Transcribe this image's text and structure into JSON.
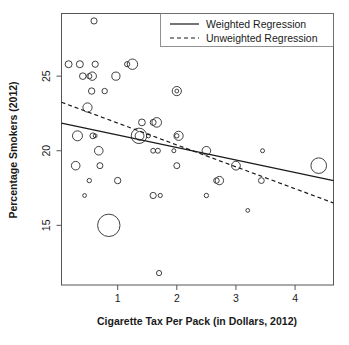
{
  "chart_data": {
    "type": "scatter",
    "title": "",
    "xlabel": "Cigarette Tax Per Pack (in Dollars, 2012)",
    "ylabel": "Percentage Smokers (2012)",
    "xlim": [
      0.05,
      4.65
    ],
    "ylim": [
      11.0,
      29.2
    ],
    "xticks": [
      1,
      2,
      3,
      4
    ],
    "yticks": [
      15,
      20,
      25
    ],
    "xtick_labels": [
      "1",
      "2",
      "3",
      "4"
    ],
    "ytick_labels": [
      "15",
      "20",
      "25"
    ],
    "grid": false,
    "legend_position": "top-right",
    "marker": "open-circle",
    "size_encoding": "population weight (bubble radius)",
    "legend": [
      {
        "label": "Weighted Regression",
        "style": "solid"
      },
      {
        "label": "Unweighted Regression",
        "style": "dashed"
      }
    ],
    "series": [
      {
        "name": "States",
        "points": [
          {
            "x": 0.6,
            "y": 28.7,
            "r": 3.1
          },
          {
            "x": 0.17,
            "y": 25.8,
            "r": 3.5
          },
          {
            "x": 0.36,
            "y": 25.8,
            "r": 3.5
          },
          {
            "x": 0.62,
            "y": 25.8,
            "r": 3.1
          },
          {
            "x": 1.16,
            "y": 25.8,
            "r": 2.6
          },
          {
            "x": 1.25,
            "y": 25.8,
            "r": 5.2
          },
          {
            "x": 0.41,
            "y": 25.0,
            "r": 3.3
          },
          {
            "x": 0.52,
            "y": 25.0,
            "r": 2.6
          },
          {
            "x": 0.57,
            "y": 25.0,
            "r": 4.2
          },
          {
            "x": 0.97,
            "y": 25.0,
            "r": 4.1
          },
          {
            "x": 0.56,
            "y": 24.0,
            "r": 3.2
          },
          {
            "x": 0.78,
            "y": 24.0,
            "r": 2.7
          },
          {
            "x": 2.0,
            "y": 24.0,
            "r": 4.6
          },
          {
            "x": 2.0,
            "y": 24.0,
            "r": 1.9
          },
          {
            "x": 0.49,
            "y": 22.9,
            "r": 4.6
          },
          {
            "x": 1.41,
            "y": 21.9,
            "r": 3.4
          },
          {
            "x": 1.6,
            "y": 21.9,
            "r": 3.0
          },
          {
            "x": 1.66,
            "y": 21.9,
            "r": 4.8
          },
          {
            "x": 0.32,
            "y": 21.0,
            "r": 5.0
          },
          {
            "x": 0.58,
            "y": 21.0,
            "r": 2.9
          },
          {
            "x": 0.62,
            "y": 21.0,
            "r": 1.9
          },
          {
            "x": 1.36,
            "y": 21.0,
            "r": 7.7
          },
          {
            "x": 1.37,
            "y": 21.0,
            "r": 4.4
          },
          {
            "x": 1.52,
            "y": 21.0,
            "r": 2.0
          },
          {
            "x": 2.03,
            "y": 21.0,
            "r": 4.6
          },
          {
            "x": 2.0,
            "y": 21.0,
            "r": 2.2
          },
          {
            "x": 0.68,
            "y": 20.0,
            "r": 4.3
          },
          {
            "x": 1.6,
            "y": 20.0,
            "r": 2.4
          },
          {
            "x": 1.68,
            "y": 20.0,
            "r": 2.5
          },
          {
            "x": 1.95,
            "y": 20.0,
            "r": 2.0
          },
          {
            "x": 2.5,
            "y": 20.0,
            "r": 4.3
          },
          {
            "x": 3.45,
            "y": 20.0,
            "r": 2.0
          },
          {
            "x": 0.29,
            "y": 19.0,
            "r": 4.3
          },
          {
            "x": 0.7,
            "y": 19.0,
            "r": 3.0
          },
          {
            "x": 2.0,
            "y": 19.0,
            "r": 3.0
          },
          {
            "x": 3.0,
            "y": 19.0,
            "r": 4.4
          },
          {
            "x": 4.4,
            "y": 19.0,
            "r": 7.8
          },
          {
            "x": 0.52,
            "y": 18.0,
            "r": 2.2
          },
          {
            "x": 1.0,
            "y": 18.0,
            "r": 3.2
          },
          {
            "x": 2.67,
            "y": 18.0,
            "r": 2.8
          },
          {
            "x": 2.72,
            "y": 18.0,
            "r": 4.2
          },
          {
            "x": 3.43,
            "y": 18.0,
            "r": 2.9
          },
          {
            "x": 0.44,
            "y": 17.0,
            "r": 1.9
          },
          {
            "x": 1.6,
            "y": 17.0,
            "r": 3.1
          },
          {
            "x": 1.72,
            "y": 17.0,
            "r": 2.1
          },
          {
            "x": 2.5,
            "y": 17.0,
            "r": 2.2
          },
          {
            "x": 3.2,
            "y": 16.0,
            "r": 1.9
          },
          {
            "x": 0.85,
            "y": 15.0,
            "r": 11.2
          },
          {
            "x": 1.7,
            "y": 11.8,
            "r": 2.6
          }
        ]
      }
    ],
    "fit_lines": [
      {
        "name": "Weighted Regression",
        "style": "solid",
        "x_start": 0.05,
        "y_start": 21.85,
        "x_end": 4.65,
        "y_end": 18.0
      },
      {
        "name": "Unweighted Regression",
        "style": "dashed",
        "x_start": 0.05,
        "y_start": 23.25,
        "x_end": 4.65,
        "y_end": 16.5
      }
    ]
  }
}
